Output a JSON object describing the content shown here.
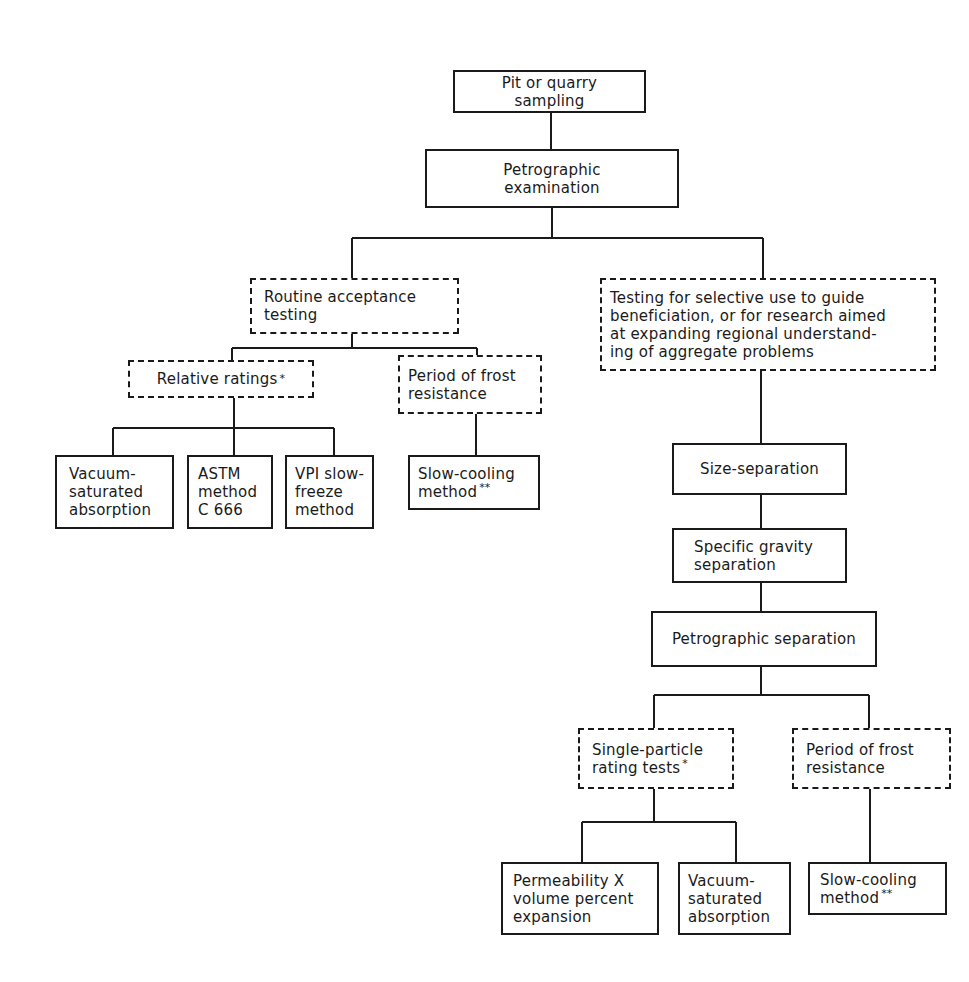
{
  "diagram": {
    "type": "flowchart",
    "nodes": {
      "pit_sampling": {
        "label": "Pit or quarry\nsampling",
        "style": "solid"
      },
      "petrographic_exam": {
        "label": "Petrographic\nexamination",
        "style": "solid"
      },
      "routine_acceptance": {
        "label": "Routine acceptance\ntesting",
        "style": "dashed"
      },
      "selective_use": {
        "label": "Testing for selective use to guide\nbeneficiation, or for research aimed\nat expanding regional understand-\ning of aggregate problems",
        "style": "dashed"
      },
      "relative_ratings": {
        "label": "Relative ratings",
        "mark": "*",
        "style": "dashed"
      },
      "frost_left": {
        "label": "Period of frost\nresistance",
        "style": "dashed"
      },
      "vacuum_left": {
        "label": "Vacuum-\nsaturated\nabsorption",
        "style": "solid"
      },
      "astm": {
        "label": "ASTM\nmethod\nC 666",
        "style": "solid"
      },
      "vpi": {
        "label": "VPI slow-\nfreeze\nmethod",
        "style": "solid"
      },
      "slow_cooling_left": {
        "label": "Slow-cooling\nmethod",
        "mark": "**",
        "style": "solid"
      },
      "size_separation": {
        "label": "Size-separation",
        "style": "solid"
      },
      "specific_gravity": {
        "label": "Specific gravity\nseparation",
        "style": "solid"
      },
      "petrographic_separation": {
        "label": "Petrographic separation",
        "style": "solid"
      },
      "single_particle": {
        "label": "Single-particle\nrating tests",
        "mark": "*",
        "style": "dashed"
      },
      "frost_right": {
        "label": "Period of frost\nresistance",
        "style": "dashed"
      },
      "permeability": {
        "label": "Permeability X\nvolume percent\nexpansion",
        "style": "solid"
      },
      "vacuum_right": {
        "label": "Vacuum-\nsaturated\nabsorption",
        "style": "solid"
      },
      "slow_cooling_right": {
        "label": "Slow-cooling\nmethod",
        "mark": "**",
        "style": "solid"
      }
    },
    "edges": [
      [
        "pit_sampling",
        "petrographic_exam"
      ],
      [
        "petrographic_exam",
        "routine_acceptance"
      ],
      [
        "petrographic_exam",
        "selective_use"
      ],
      [
        "routine_acceptance",
        "relative_ratings"
      ],
      [
        "routine_acceptance",
        "frost_left"
      ],
      [
        "relative_ratings",
        "vacuum_left"
      ],
      [
        "relative_ratings",
        "astm"
      ],
      [
        "relative_ratings",
        "vpi"
      ],
      [
        "frost_left",
        "slow_cooling_left"
      ],
      [
        "selective_use",
        "size_separation"
      ],
      [
        "size_separation",
        "specific_gravity"
      ],
      [
        "specific_gravity",
        "petrographic_separation"
      ],
      [
        "petrographic_separation",
        "single_particle"
      ],
      [
        "petrographic_separation",
        "frost_right"
      ],
      [
        "single_particle",
        "permeability"
      ],
      [
        "single_particle",
        "vacuum_right"
      ],
      [
        "frost_right",
        "slow_cooling_right"
      ]
    ],
    "colors": {
      "line": "#1a1a1a",
      "background": "#ffffff"
    }
  }
}
